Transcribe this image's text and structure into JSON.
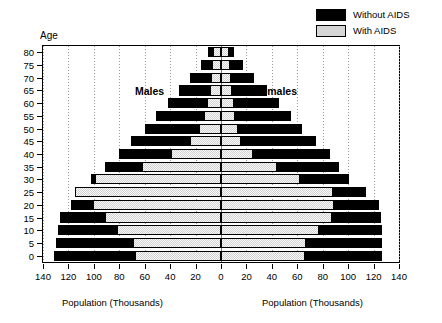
{
  "legend": {
    "position": "top-right",
    "items": [
      {
        "label": "Without AIDS",
        "swatch": "black-swatch",
        "color": "#000000"
      },
      {
        "label": "With AIDS",
        "swatch": "gray-swatch",
        "color": "#d2d2d2"
      }
    ]
  },
  "axes": {
    "y_title": "Age",
    "x_title_left": "Population (Thousands)",
    "x_title_right": "Population (Thousands)"
  },
  "captions": {
    "males": "Males",
    "females": "Females"
  },
  "chart_data": {
    "type": "bar",
    "subtype": "population-pyramid",
    "title": "",
    "xlabel": "Population (Thousands)",
    "ylabel": "Age",
    "grid": true,
    "legend_position": "top-right",
    "orientation": "horizontal-back-to-back",
    "categories": [
      "0",
      "5",
      "10",
      "15",
      "20",
      "25",
      "30",
      "35",
      "40",
      "45",
      "50",
      "55",
      "60",
      "65",
      "70",
      "75",
      "80"
    ],
    "x_ticks_left": [
      140,
      120,
      100,
      80,
      60,
      40,
      20,
      0
    ],
    "x_ticks_right": [
      0,
      20,
      40,
      60,
      80,
      100,
      120,
      140
    ],
    "xlim": [
      -140,
      140
    ],
    "units": "thousands",
    "series": [
      {
        "name": "Without AIDS",
        "color": "#000000",
        "side": "male",
        "values": [
          131,
          130,
          128,
          127,
          118,
          112,
          102,
          91,
          80,
          71,
          60,
          51,
          42,
          33,
          24,
          16,
          10
        ]
      },
      {
        "name": "With AIDS",
        "color": "#d2d2d2",
        "side": "male",
        "values": [
          68,
          69,
          82,
          91,
          101,
          115,
          99,
          62,
          39,
          24,
          17,
          13,
          11,
          9,
          8,
          7,
          6
        ]
      },
      {
        "name": "Without AIDS",
        "color": "#000000",
        "side": "female",
        "values": [
          127,
          127,
          127,
          126,
          124,
          114,
          101,
          93,
          86,
          75,
          64,
          55,
          46,
          36,
          26,
          17,
          10
        ]
      },
      {
        "name": "With AIDS",
        "color": "#d2d2d2",
        "side": "female",
        "values": [
          66,
          67,
          77,
          87,
          89,
          88,
          62,
          44,
          25,
          16,
          13,
          11,
          10,
          9,
          8,
          7,
          6
        ]
      }
    ]
  }
}
